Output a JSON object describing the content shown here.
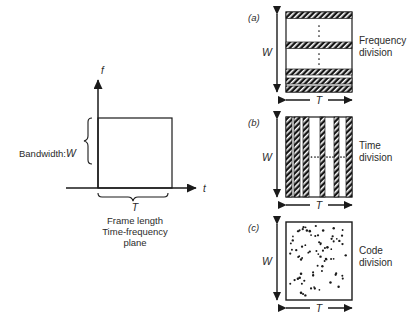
{
  "left_diagram": {
    "name": "time-frequency-plane",
    "y_axis_label": "f",
    "x_axis_label": "t",
    "bandwidth_label": "Bandwidth:",
    "bandwidth_symbol": "W",
    "frame_symbol": "T",
    "caption_line1": "Frame length",
    "caption_line2": "Time-frequency",
    "caption_line3": "plane"
  },
  "panels": [
    {
      "tag": "(a)",
      "name": "frequency-division",
      "vertical_symbol": "W",
      "horizontal_symbol": "T",
      "label_line1": "Frequency",
      "label_line2": "division",
      "pattern": "horizontal-hatched-bands",
      "bands": [
        {
          "y": 10,
          "h": 7
        },
        {
          "y": 40,
          "h": 7
        },
        {
          "y": 64,
          "h": 7
        },
        {
          "y": 74,
          "h": 7
        },
        {
          "y": 84,
          "h": 7
        }
      ],
      "ellipsis_orientation": "vertical",
      "ellipsis_groups": 2
    },
    {
      "tag": "(b)",
      "name": "time-division",
      "vertical_symbol": "W",
      "horizontal_symbol": "T",
      "label_line1": "Time",
      "label_line2": "division",
      "pattern": "vertical-hatched-stripes",
      "stripes": [
        {
          "x": 0,
          "w": 6
        },
        {
          "x": 8,
          "w": 6
        },
        {
          "x": 17,
          "w": 6
        },
        {
          "x": 34,
          "w": 5
        },
        {
          "x": 48,
          "w": 5
        },
        {
          "x": 60,
          "w": 6
        }
      ],
      "ellipsis_orientation": "horizontal",
      "ellipsis_groups": 3
    },
    {
      "tag": "(c)",
      "name": "code-division",
      "vertical_symbol": "W",
      "horizontal_symbol": "T",
      "label_line1": "Code",
      "label_line2": "division",
      "pattern": "random-dots",
      "dot_count": 78
    }
  ],
  "colors": {
    "ink": "#1a1a1a",
    "text": "#2b2b2b",
    "background": "#ffffff"
  }
}
